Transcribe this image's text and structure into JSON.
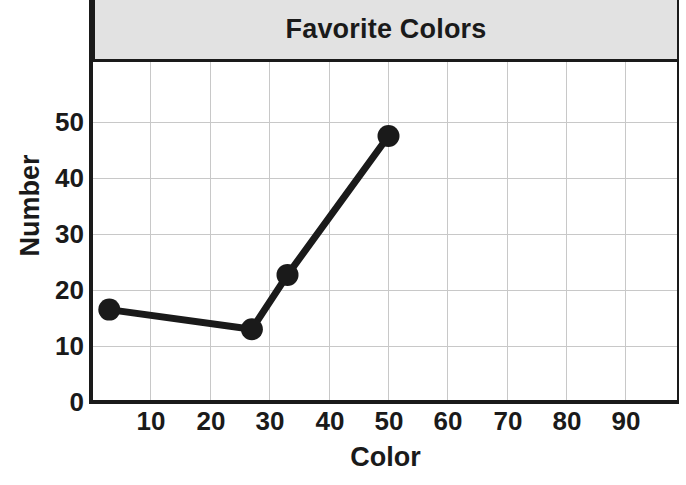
{
  "chart_data": {
    "type": "line",
    "title": "Favorite Colors",
    "xlabel": "Color",
    "ylabel": "Number",
    "x": [
      3,
      27,
      33,
      50
    ],
    "values": [
      16.5,
      13,
      22.7,
      47.5
    ],
    "series": [
      {
        "name": "Favorite Colors",
        "x": [
          3,
          27,
          33,
          50
        ],
        "values": [
          16.5,
          13,
          22.7,
          47.5
        ]
      }
    ],
    "xlim": [
      0,
      99
    ],
    "ylim": [
      0,
      57
    ],
    "xticks": [
      10,
      20,
      30,
      40,
      50,
      60,
      70,
      80,
      90
    ],
    "yticks": [
      0,
      10,
      20,
      30,
      40,
      50
    ],
    "xtick_labels": [
      "10",
      "20",
      "30",
      "40",
      "50",
      "60",
      "70",
      "80",
      "90"
    ],
    "ytick_labels": [
      "0",
      "10",
      "20",
      "30",
      "40",
      "50"
    ],
    "grid": true,
    "legend": false,
    "marker": "circle",
    "line_color": "#1a1a1a",
    "marker_color": "#1a1a1a",
    "grid_color": "#c8c8c8",
    "title_band_color": "#e2e2e2",
    "axis_color": "#1a1a1a"
  },
  "header": {
    "title": "Favorite Colors"
  },
  "axes": {
    "y_title": "Number",
    "x_title": "Color",
    "y_ticks": [
      {
        "label": "50"
      },
      {
        "label": "40"
      },
      {
        "label": "30"
      },
      {
        "label": "20"
      },
      {
        "label": "10"
      },
      {
        "label": "0"
      }
    ],
    "x_ticks": [
      {
        "label": "10"
      },
      {
        "label": "20"
      },
      {
        "label": "30"
      },
      {
        "label": "40"
      },
      {
        "label": "50"
      },
      {
        "label": "60"
      },
      {
        "label": "70"
      },
      {
        "label": "80"
      },
      {
        "label": "90"
      }
    ]
  }
}
